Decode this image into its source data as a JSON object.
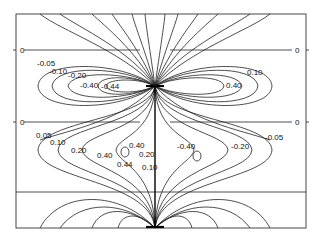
{
  "figure": {
    "type": "contour-plot",
    "frame": {
      "x": 16,
      "y": 14,
      "w": 290,
      "h": 214
    },
    "zero_lines_y": [
      50,
      122
    ],
    "divider_y": 192,
    "sources": [
      {
        "x": 155,
        "y": 86
      },
      {
        "x": 155,
        "y": 228
      }
    ],
    "edge_labels": {
      "left_top": "0",
      "left_mid": "0",
      "right_top": "0",
      "right_mid": "0"
    },
    "upper_labels_negative": [
      "-0.05",
      "-0.10",
      "-0.20",
      "-0.40",
      "-0.44"
    ],
    "upper_labels_positive": [
      "0.10",
      "0.40"
    ],
    "lower_labels_left": [
      "0.05",
      "0.10",
      "0.20",
      "0.40",
      "0.40",
      "0.44",
      "0.20",
      "0.10"
    ],
    "lower_labels_right": [
      "-0.40",
      "-0.20",
      "-0.05"
    ]
  }
}
